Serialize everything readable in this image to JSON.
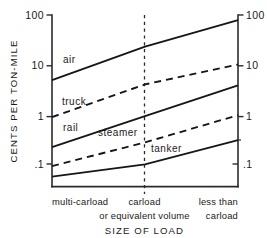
{
  "chart_data": {
    "type": "line",
    "title": "",
    "xlabel": "SIZE OF LOAD",
    "ylabel": "CENTS PER TON-MILE",
    "yscale": "log",
    "ylim": [
      0.055,
      100
    ],
    "y_ticks": [
      "100",
      "10",
      "1",
      ".1"
    ],
    "y_tick_values": [
      100,
      10,
      1,
      0.1
    ],
    "y_ticks_right": [
      "100",
      "10",
      "1",
      ".1"
    ],
    "y_right_minor_tick_value": 0.4,
    "grid": false,
    "legend": "inline-labels",
    "x_categories": [
      "multi-carload",
      "carload",
      "less than"
    ],
    "x_category_lines": [
      [
        "multi-carload"
      ],
      [
        "carload",
        "or equivalent volume"
      ],
      [
        "less than",
        "carload"
      ]
    ],
    "x_divider_at": "carload",
    "series": [
      {
        "name": "air",
        "style": "solid",
        "label": "air",
        "values": [
          5.8,
          25.0,
          80.0
        ],
        "x_fracs": [
          0.0,
          0.5,
          1.0
        ],
        "label_at": {
          "x_frac": 0.07,
          "value": 12.0
        }
      },
      {
        "name": "truck",
        "style": "dashed",
        "label": "truck",
        "values": [
          1.15,
          4.8,
          11.5
        ],
        "x_fracs": [
          0.0,
          0.5,
          1.0
        ],
        "label_at": {
          "x_frac": 0.07,
          "value": 2.6
        }
      },
      {
        "name": "rail",
        "style": "solid",
        "label": "rail",
        "values": [
          0.31,
          1.2,
          4.6
        ],
        "x_fracs": [
          0.0,
          0.5,
          1.0
        ],
        "label_at": {
          "x_frac": 0.09,
          "value": 0.62
        }
      },
      {
        "name": "steamer",
        "style": "dashed",
        "label": "steamer",
        "values": [
          0.135,
          0.38,
          1.25
        ],
        "x_fracs": [
          0.0,
          0.5,
          1.0
        ],
        "label_at": {
          "x_frac": 0.34,
          "value": 0.55
        }
      },
      {
        "name": "tanker",
        "style": "solid",
        "label": "tanker",
        "values": [
          0.085,
          0.145,
          0.42
        ],
        "x_fracs": [
          0.0,
          0.5,
          1.0
        ],
        "label_at": {
          "x_frac": 0.58,
          "value": 0.25
        }
      }
    ]
  },
  "axes": {
    "y_title": "CENTS PER TON-MILE",
    "x_title": "SIZE OF LOAD",
    "left_ticks": [
      "100",
      "10",
      "1",
      ".1"
    ],
    "right_ticks": [
      "100",
      "10",
      "1",
      ".1"
    ]
  },
  "x_labels": {
    "left": "multi-carload",
    "center_line1": "carload",
    "center_line2": "or equivalent volume",
    "right_line1": "less than",
    "right_line2": "carload"
  },
  "series_labels": {
    "air": "air",
    "truck": "truck",
    "rail": "rail",
    "steamer": "steamer",
    "tanker": "tanker"
  }
}
